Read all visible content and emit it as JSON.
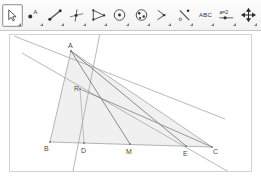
{
  "app": {
    "title": "Dynamic Geometry Construction",
    "canvas_bg": "#ffffff",
    "line_color": "#8f8f8f",
    "dark_line_color": "#6e6e6e",
    "fill_color": "#ededed",
    "label_color": "#4a4a4a",
    "frame_color": "#d2d2d2"
  },
  "toolbar": {
    "selected_index": 0,
    "tools": [
      {
        "name": "move-tool",
        "icon": "arrow-pointer-icon",
        "label": "",
        "selected": true,
        "has_submenu": true
      },
      {
        "name": "point-tool",
        "icon": "point-icon",
        "label": "",
        "selected": false,
        "has_submenu": true
      },
      {
        "name": "line-tool",
        "icon": "segment-icon",
        "label": "",
        "selected": false,
        "has_submenu": true
      },
      {
        "name": "perpendicular-tool",
        "icon": "perpendicular-line-icon",
        "label": "",
        "selected": false,
        "has_submenu": true
      },
      {
        "name": "polygon-tool",
        "icon": "polygon-icon",
        "label": "",
        "selected": false,
        "has_submenu": true
      },
      {
        "name": "circle-tool",
        "icon": "circle-center-icon",
        "label": "",
        "selected": false,
        "has_submenu": true
      },
      {
        "name": "conic-tool",
        "icon": "ellipse-icon",
        "label": "",
        "selected": false,
        "has_submenu": true
      },
      {
        "name": "angle-tool",
        "icon": "angle-icon",
        "label": "",
        "selected": false,
        "has_submenu": true
      },
      {
        "name": "reflect-tool",
        "icon": "reflect-line-icon",
        "label": "",
        "selected": false,
        "has_submenu": true
      },
      {
        "name": "text-tool",
        "icon": "abc-text-icon",
        "label": "ABC",
        "selected": false,
        "has_submenu": true
      },
      {
        "name": "slider-tool",
        "icon": "slider-ab2-icon",
        "label": "a=2",
        "selected": false,
        "has_submenu": true
      },
      {
        "name": "pan-tool",
        "icon": "move-graphics-icon",
        "label": "",
        "selected": false,
        "has_submenu": true
      }
    ]
  },
  "figure": {
    "type": "euclidean-construction",
    "points": [
      {
        "id": "A",
        "label": "A",
        "x": 71,
        "y": 51,
        "label_dx": -2,
        "label_dy": -9
      },
      {
        "id": "R",
        "label": "R",
        "x": 80,
        "y": 89,
        "label_dx": -5,
        "label_dy": -2
      },
      {
        "id": "B",
        "label": "B",
        "x": 50,
        "y": 142,
        "label_dx": -5,
        "label_dy": 4
      },
      {
        "id": "D",
        "label": "D",
        "x": 84,
        "y": 143,
        "label_dx": -2,
        "label_dy": 5
      },
      {
        "id": "M",
        "label": "M",
        "x": 130,
        "y": 144,
        "label_dx": -3,
        "label_dy": 5
      },
      {
        "id": "E",
        "label": "E",
        "x": 186,
        "y": 146,
        "label_dx": -2,
        "label_dy": 5
      },
      {
        "id": "C",
        "label": "C",
        "x": 212,
        "y": 147,
        "label_dx": 2,
        "label_dy": 3
      }
    ],
    "polygon_fill": "B,A,C",
    "segments": [
      {
        "name": "side-AB",
        "from": "A",
        "to": "B",
        "weight": 0.8,
        "shade": "light"
      },
      {
        "name": "side-BC",
        "from": "B",
        "to": "C",
        "weight": 0.8,
        "shade": "light"
      },
      {
        "name": "side-AC",
        "from": "A",
        "to": "C",
        "weight": 0.8,
        "shade": "light"
      },
      {
        "name": "cevian-A-M",
        "from": "A",
        "to": "M",
        "weight": 0.9,
        "shade": "dark"
      },
      {
        "name": "cevian-A-E",
        "from": "A",
        "to": "E",
        "weight": 0.9,
        "shade": "dark"
      },
      {
        "name": "segment-R-C",
        "from": "R",
        "to": "C",
        "weight": 0.9,
        "shade": "dark"
      },
      {
        "name": "segment-R-D",
        "from": "R",
        "to": "D",
        "weight": 0.8,
        "shade": "light"
      }
    ],
    "lines": [
      {
        "name": "vertical-line-through-D",
        "x1": 100,
        "y1": 33,
        "x2": 74,
        "y2": 176,
        "shade": "light"
      },
      {
        "name": "transversal-upper",
        "x1": 18,
        "y1": 39,
        "x2": 215,
        "y2": 113,
        "shade": "light"
      },
      {
        "name": "transversal-lower",
        "x1": 28,
        "y1": 55,
        "x2": 237,
        "y2": 176,
        "shade": "light"
      }
    ]
  }
}
